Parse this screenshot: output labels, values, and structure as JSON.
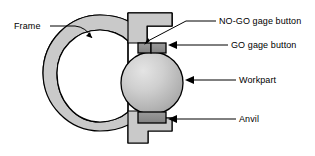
{
  "figure": {
    "type": "technical-diagram",
    "background_color": "#ffffff",
    "line_color": "#000000",
    "width": 315,
    "height": 156
  },
  "labels": {
    "frame": "Frame",
    "nogo_gage_button": "NO-GO gage button",
    "go_gage_button": "GO gage button",
    "workpart": "Workpart",
    "anvil": "Anvil"
  },
  "parts": {
    "frame": {
      "name": "Frame",
      "fill_color": "#c9c9c9",
      "stroke_color": "#000000",
      "shape": "c-frame"
    },
    "workpart": {
      "name": "Workpart",
      "fill_color": "#b4b4b4",
      "highlight_color": "#e2e2e2",
      "stroke_color": "#000000",
      "shape": "sphere"
    },
    "nogo_gage_button": {
      "name": "NO-GO gage button",
      "fill_color": "#8e8e8e",
      "stroke_color": "#000000",
      "shape": "rectangle"
    },
    "go_gage_button": {
      "name": "GO gage button",
      "fill_color": "#8e8e8e",
      "stroke_color": "#000000",
      "shape": "rectangle"
    },
    "anvil": {
      "name": "Anvil",
      "fill_color": "#8e8e8e",
      "stroke_color": "#000000",
      "shape": "rectangle"
    }
  },
  "leaders": {
    "frame": "line-with-arrow-pointing-down-right",
    "nogo_gage_button": "line-with-arrow-pointing-down-left",
    "go_gage_button": "line-with-arrow-pointing-left",
    "workpart": "line-with-arrow-pointing-left",
    "anvil": "line-with-arrow-pointing-left"
  }
}
